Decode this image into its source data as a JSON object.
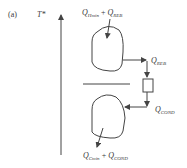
{
  "figure": {
    "panel_label": "(a)",
    "axis": {
      "label": "T*",
      "direction": "up"
    },
    "top_region": {
      "input_label": {
        "q": "Q",
        "sub": "Hmin",
        "plus": "+",
        "q2": "Q",
        "sub2": "REB"
      },
      "output_label": {
        "q": "Q",
        "sub": "REB"
      }
    },
    "heat_pump_box": {
      "shape": "rectangle"
    },
    "bottom_region": {
      "input_label": {
        "q": "Q",
        "sub": "COND"
      },
      "output_label": {
        "q": "Q",
        "sub": "Cmin",
        "plus": "+",
        "q2": "Q",
        "sub2": "COND"
      }
    },
    "colors": {
      "line": "#444444",
      "text": "#3a3a3a",
      "background": "#ffffff"
    }
  }
}
